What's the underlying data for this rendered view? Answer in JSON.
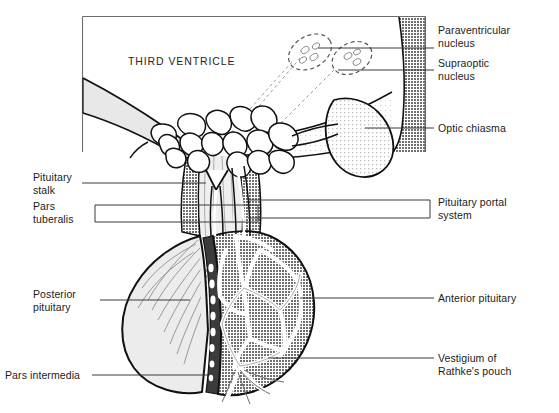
{
  "figure": {
    "background_color": "#ffffff",
    "ink_color": "#1b1b1b"
  },
  "interior_labels": {
    "third_ventricle": "THIRD VENTRICLE"
  },
  "labels_right": [
    {
      "id": "paraventricular-nucleus",
      "text": "Paraventricular\nnucleus"
    },
    {
      "id": "supraoptic-nucleus",
      "text": "Supraoptic\nnucleus"
    },
    {
      "id": "optic-chiasma",
      "text": "Optic chiasma"
    },
    {
      "id": "pituitary-portal-system",
      "text": "Pituitary portal\nsystem"
    },
    {
      "id": "anterior-pituitary",
      "text": "Anterior pituitary"
    },
    {
      "id": "vestigium-of-rathkes-pouch",
      "text": "Vestigium of\nRathke's pouch"
    }
  ],
  "labels_left": [
    {
      "id": "pituitary-stalk",
      "text": "Pituitary\nstalk"
    },
    {
      "id": "pars-tuberalis",
      "text": "Pars\ntuberalis"
    },
    {
      "id": "posterior-pituitary",
      "text": "Posterior\npituitary"
    },
    {
      "id": "pars-intermedia",
      "text": "Pars intermedia"
    }
  ],
  "colors": {
    "outline": "#111111",
    "ventricle_wall_fill": "#e4e4e4",
    "hypothalamus_fill": "#b4b4b4",
    "optic_chiasma_fill": "#dcdcdc",
    "posterior_pituitary_fill": "#e9e9e9",
    "anterior_pituitary_fill": "#a9a9a9",
    "pars_tuberalis_fill": "#9d9d9d",
    "pars_intermedia_fill": "#3a3a3a",
    "stalk_core_fill": "#eeeeee",
    "leader_line": "#3b3b3b",
    "frame": "#6d6d6d"
  }
}
